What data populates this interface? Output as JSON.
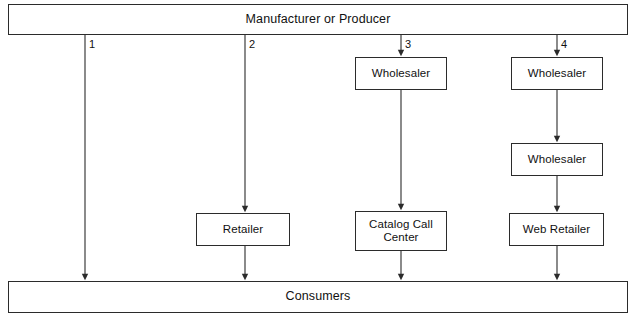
{
  "diagram": {
    "title_bar": {
      "label": "Manufacturer or Producer"
    },
    "bottom_bar": {
      "label": "Consumers"
    },
    "channel_numbers": [
      "1",
      "2",
      "3",
      "4"
    ],
    "nodes": {
      "wholesaler_c3": "Wholesaler",
      "wholesaler_c4_top": "Wholesaler",
      "wholesaler_c4_bottom": "Wholesaler",
      "retailer": "Retailer",
      "catalog_call_center": "Catalog Call\nCenter",
      "catalog_call_center_line1": "Catalog Call",
      "catalog_call_center_line2": "Center",
      "web_retailer": "Web Retailer"
    },
    "colors": {
      "stroke": "#2b2b2b",
      "text": "#111111",
      "background": "#ffffff"
    }
  }
}
